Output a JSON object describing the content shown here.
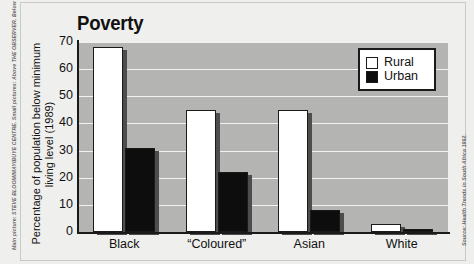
{
  "credits": {
    "left": "Main picture: STEVE BLOOM/MAYIBUYE CENTRE. Small pictures: Above THE OBSERVER. Below",
    "right": "Source: Health Trends in South Africa 1992."
  },
  "legend": {
    "items": [
      {
        "label": "Rural",
        "key": "rural",
        "color": "#ffffff"
      },
      {
        "label": "Urban",
        "key": "urban",
        "color": "#0d0d0d"
      }
    ]
  },
  "chart_data": {
    "type": "bar",
    "title": "Poverty",
    "xlabel": "",
    "ylabel_lines": [
      "Percentage of population below minimum",
      "living level (1989)"
    ],
    "ylabel": "Percentage of population below minimum living level (1989)",
    "categories": [
      "Black",
      "“Coloured”",
      "Asian",
      "White"
    ],
    "series": [
      {
        "name": "Rural",
        "values": [
          68,
          45,
          45,
          3
        ]
      },
      {
        "name": "Urban",
        "values": [
          31,
          22,
          8,
          1
        ]
      }
    ],
    "ylim": [
      0,
      70
    ],
    "yticks": [
      0,
      10,
      20,
      30,
      40,
      50,
      60,
      70
    ],
    "ytick_labels": [
      "0",
      "10",
      "20",
      "30",
      "40",
      "50",
      "60",
      "70"
    ],
    "grid": true,
    "grid_color": "#f2f2f0",
    "plot_background": "#b4b4b2",
    "legend_position": "top-right"
  }
}
